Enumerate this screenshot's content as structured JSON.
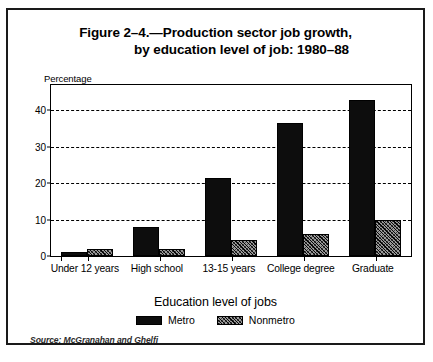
{
  "figure": {
    "title_line_1": "Figure 2–4.—Production sector job growth,",
    "title_line_2": "by education level of job: 1980–88",
    "source": "Source: McGranahan and Ghelfi"
  },
  "chart_data": {
    "type": "bar",
    "xlabel": "Education level of jobs",
    "ylabel": "Percentage",
    "categories": [
      "Under 12 years",
      "High school",
      "13-15 years",
      "College degree",
      "Graduate"
    ],
    "series": [
      {
        "name": "Metro",
        "values": [
          1,
          8,
          21.5,
          36.5,
          43
        ]
      },
      {
        "name": "Nonmetro",
        "values": [
          2,
          2,
          4.5,
          6,
          10
        ]
      }
    ],
    "ylim": [
      0,
      47
    ],
    "yticks": [
      0,
      10,
      20,
      30,
      40
    ],
    "ytick_labels": [
      "0",
      "10",
      "20",
      "30",
      "40"
    ],
    "grid": "horizontal-dashed",
    "legend_position": "bottom-center"
  }
}
